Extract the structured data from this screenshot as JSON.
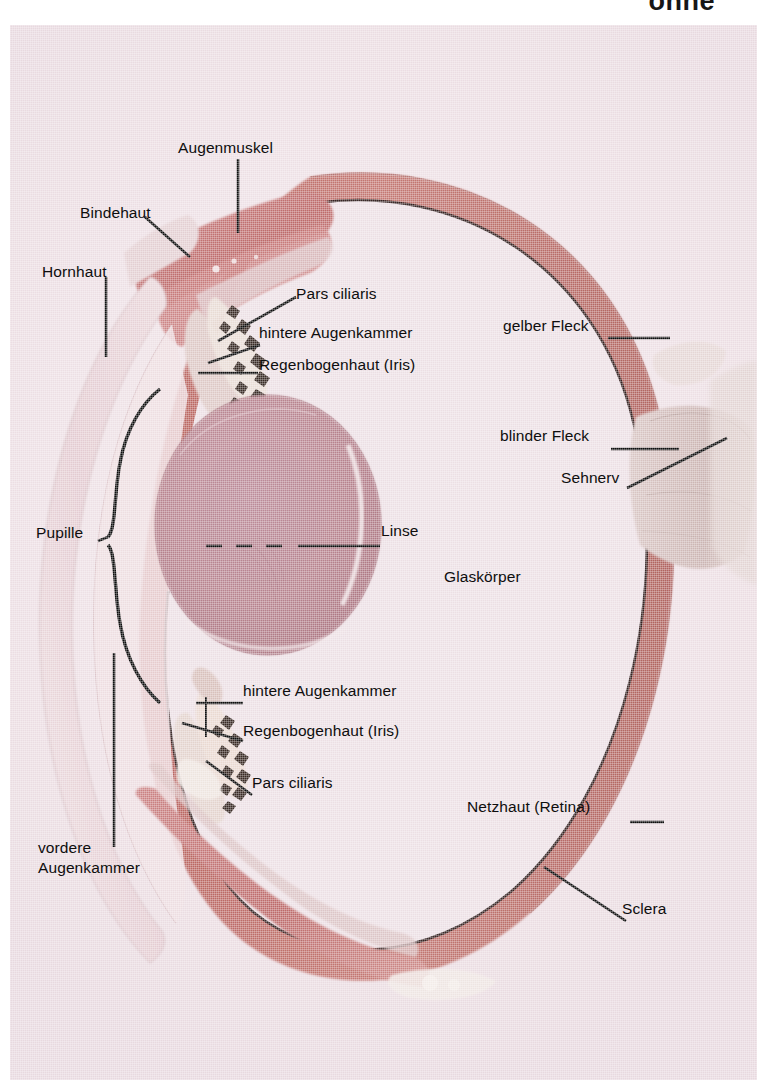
{
  "header": {
    "cropped_word": "ohne"
  },
  "figure": {
    "kind": "histological-cross-section-photograph",
    "language": "de",
    "background_color": "#ecdfe4",
    "sclera_color": "#c0726f",
    "uvea_color": "#b7625f",
    "lens_color": "#b7848f",
    "cornea_color": "#e6cfd3",
    "muscle_color": "#c9797a",
    "nerve_color": "#cdb6b5",
    "ink_color": "#0e0e0e"
  },
  "labels": [
    {
      "id": "augenmuskel",
      "text": "Augenmuskel",
      "x": 178,
      "y": 138
    },
    {
      "id": "bindehaut",
      "text": "Bindehaut",
      "x": 80,
      "y": 203
    },
    {
      "id": "hornhaut",
      "text": "Hornhaut",
      "x": 42,
      "y": 262
    },
    {
      "id": "pars-ciliaris-top",
      "text": "Pars ciliaris",
      "x": 296,
      "y": 284
    },
    {
      "id": "hintere-augenkammer-top",
      "text": "hintere Augenkammer",
      "x": 259,
      "y": 323
    },
    {
      "id": "regenbogenhaut-top",
      "text": "Regenbogenhaut (Iris)",
      "x": 259,
      "y": 355
    },
    {
      "id": "gelber-fleck",
      "text": "gelber Fleck",
      "x": 503,
      "y": 316
    },
    {
      "id": "blinder-fleck",
      "text": "blinder Fleck",
      "x": 500,
      "y": 426
    },
    {
      "id": "sehnerv",
      "text": "Sehnerv",
      "x": 561,
      "y": 468
    },
    {
      "id": "pupille",
      "text": "Pupille",
      "x": 36,
      "y": 523
    },
    {
      "id": "linse",
      "text": "Linse",
      "x": 381,
      "y": 521
    },
    {
      "id": "glaskoerper",
      "text": "Glaskörper",
      "x": 444,
      "y": 567
    },
    {
      "id": "hintere-augenkammer-bot",
      "text": "hintere Augenkammer",
      "x": 243,
      "y": 681
    },
    {
      "id": "regenbogenhaut-bot",
      "text": "Regenbogenhaut (Iris)",
      "x": 243,
      "y": 721
    },
    {
      "id": "pars-ciliaris-bot",
      "text": "Pars ciliaris",
      "x": 252,
      "y": 773
    },
    {
      "id": "netzhaut-retina",
      "text": "Netzhaut (Retina)",
      "x": 467,
      "y": 797
    },
    {
      "id": "sclera",
      "text": "Sclera",
      "x": 622,
      "y": 899
    },
    {
      "id": "vordere-augenkammer-1",
      "text": "vordere",
      "x": 38,
      "y": 838
    },
    {
      "id": "vordere-augenkammer-2",
      "text": "Augenkammer",
      "x": 38,
      "y": 858
    }
  ],
  "leader_lines": [
    {
      "id": "leader-augenmuskel",
      "kind": "straight"
    },
    {
      "id": "leader-bindehaut",
      "kind": "straight"
    },
    {
      "id": "leader-hornhaut",
      "kind": "straight"
    },
    {
      "id": "leader-pars-ciliaris-top",
      "kind": "straight"
    },
    {
      "id": "leader-hintere-augenkammer-top",
      "kind": "straight"
    },
    {
      "id": "leader-regenbogenhaut-top",
      "kind": "straight"
    },
    {
      "id": "leader-gelber-fleck",
      "kind": "straight"
    },
    {
      "id": "leader-blinder-fleck",
      "kind": "straight"
    },
    {
      "id": "leader-sehnerv",
      "kind": "straight"
    },
    {
      "id": "leader-pupille",
      "kind": "brace"
    },
    {
      "id": "leader-linse",
      "kind": "dashed-then-solid"
    },
    {
      "id": "leader-hintere-augenkammer-bot",
      "kind": "straight-with-tick"
    },
    {
      "id": "leader-regenbogenhaut-bot",
      "kind": "straight"
    },
    {
      "id": "leader-pars-ciliaris-bot",
      "kind": "straight"
    },
    {
      "id": "leader-netzhaut-retina",
      "kind": "straight"
    },
    {
      "id": "leader-sclera",
      "kind": "straight"
    },
    {
      "id": "leader-vordere-augenkammer",
      "kind": "straight"
    }
  ]
}
